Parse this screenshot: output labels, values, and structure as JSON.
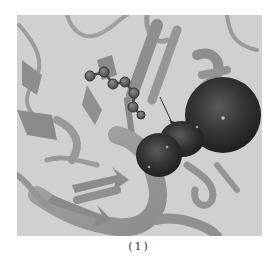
{
  "figure": {
    "panel_label": "(1)",
    "background_color": "#d0d0d0",
    "elements": {
      "protein": "protein-ribbon-structure",
      "ligand": "ball-and-stick-ligand",
      "pocket": "binding-pocket-surface",
      "arrow": "pointer-arrow"
    },
    "colors": {
      "ribbon": "#9a9a9a",
      "ribbon_dark": "#7e7e7e",
      "ligand_atom": "#555555",
      "pocket": "#2e2e2e",
      "arrow": "#333333"
    }
  }
}
